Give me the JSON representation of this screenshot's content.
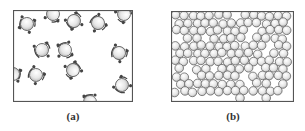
{
  "figure": {
    "panels": [
      {
        "id": "a",
        "caption": "(a)",
        "description": "Sparse gas: molecules with attached side groups, widely separated",
        "molecule_count": 16
      },
      {
        "id": "b",
        "caption": "(b)",
        "description": "Dense liquid: closely packed spherical molecules",
        "molecule_count": 140
      }
    ],
    "colors": {
      "border": "#555555",
      "sphere_highlight": "#ffffff",
      "sphere_shade": "#b5b5b5",
      "sphere_outline": "#666666",
      "attachment": "#444444",
      "background": "#ffffff"
    }
  }
}
